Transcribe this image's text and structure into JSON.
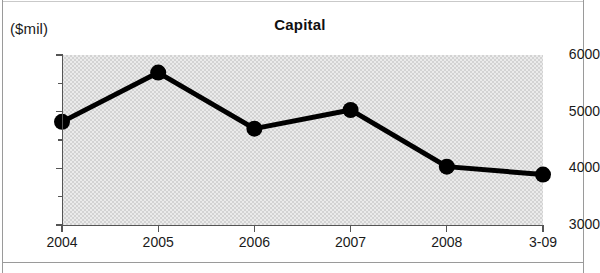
{
  "figure": {
    "unit_label": "($mil)",
    "title": "Capital"
  },
  "chart_data": {
    "type": "line",
    "title": "Capital",
    "subtitle": "",
    "xlabel": "",
    "ylabel": "($mil)",
    "unit": "$mil",
    "categories": [
      "2004",
      "2005",
      "2006",
      "2007",
      "2008",
      "3-09"
    ],
    "values": [
      4820,
      5690,
      4700,
      5030,
      4030,
      3890
    ],
    "series": [
      {
        "name": "Capital",
        "values": [
          4820,
          5690,
          4700,
          5030,
          4030,
          3890
        ]
      }
    ],
    "ylim": [
      3000,
      6000
    ],
    "ytick_labels": [
      "3000",
      "4000",
      "5000",
      "6000"
    ],
    "ytick_values": [
      3000,
      4000,
      5000,
      6000
    ],
    "yminor_tick_values": [
      3500,
      4500,
      5500
    ],
    "xtick_labels": [
      "2004",
      "2005",
      "2006",
      "2007",
      "2008",
      "3-09"
    ],
    "grid": false,
    "legend": false,
    "legend_position": "none",
    "marker": "circle",
    "line_color": "#000000",
    "marker_color": "#000000",
    "plot_background_color": "#d3d3d3",
    "figure_background_color": "#ffffff",
    "annotations": []
  }
}
